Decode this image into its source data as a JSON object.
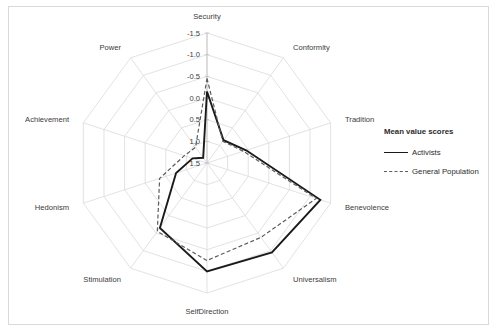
{
  "chart_data": {
    "type": "radar",
    "title": "",
    "legend_title": "Mean value scores",
    "legend_position": "right",
    "grid": true,
    "categories": [
      "Security",
      "Conformity",
      "Tradition",
      "Benevolence",
      "Universalism",
      "SelfDirection",
      "Stimulation",
      "Hedonism",
      "Achievement",
      "Power"
    ],
    "tick_labels": [
      "-1.5",
      "-1.0",
      "-0.5",
      "0.0",
      "0.5",
      "1.0",
      "1.5"
    ],
    "tick_values": [
      -1.5,
      -1.0,
      -0.5,
      0.0,
      0.5,
      1.0,
      1.5
    ],
    "rlim": [
      -1.5,
      1.5
    ],
    "axis_reversed": true,
    "xlabel": "",
    "ylabel": "Mean value scores",
    "series": [
      {
        "name": "Activists",
        "style": "solid",
        "color": "#1a1a1a",
        "values": [
          -0.15,
          0.85,
          0.55,
          -1.25,
          -1.05,
          -1.0,
          -0.35,
          0.75,
          1.15,
          1.35
        ]
      },
      {
        "name": "General Population",
        "style": "dashed",
        "color": "#5c5c5c",
        "values": [
          -0.45,
          0.88,
          0.62,
          -1.15,
          -0.62,
          -0.75,
          -0.45,
          0.35,
          0.95,
          1.05
        ]
      }
    ]
  },
  "legend": {
    "title": "Mean value scores",
    "entries": [
      {
        "label": "Activists",
        "style": "solid"
      },
      {
        "label": "General Population",
        "style": "dashed"
      }
    ]
  },
  "colors": {
    "frame": "#d9d9d9",
    "grid": "#d6d6d6",
    "activists": "#1a1a1a",
    "general_population": "#5c5c5c",
    "text": "#3b3b3b",
    "background": "#ffffff"
  }
}
